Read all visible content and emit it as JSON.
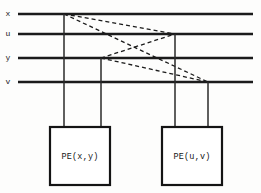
{
  "diagram": {
    "canvas": {
      "width": 261,
      "height": 193,
      "background": "#fdfdfc"
    },
    "colors": {
      "bus": "#1b1b1b",
      "drop": "#2a2a2a",
      "dashed": "#1b1b1b",
      "box_stroke": "#141414",
      "box_fill": "#ffffff",
      "text": "#171717"
    },
    "buses": [
      {
        "id": "bus-x",
        "label": "x",
        "y": 14,
        "x1": 18,
        "x2": 253,
        "label_x": 8
      },
      {
        "id": "bus-u",
        "label": "u",
        "y": 34,
        "x1": 18,
        "x2": 253,
        "label_x": 8
      },
      {
        "id": "bus-y",
        "label": "y",
        "y": 58,
        "x1": 18,
        "x2": 253,
        "label_x": 8
      },
      {
        "id": "bus-v",
        "label": "v",
        "y": 82,
        "x1": 18,
        "x2": 253,
        "label_x": 8
      }
    ],
    "drops": [
      {
        "id": "drop-x-to-left-pe",
        "from_bus": "x",
        "x": 64,
        "y1": 14,
        "y2": 127
      },
      {
        "id": "drop-y-to-left-pe",
        "from_bus": "y",
        "x": 101,
        "y1": 58,
        "y2": 127
      },
      {
        "id": "drop-u-to-right-pe",
        "from_bus": "u",
        "x": 175,
        "y1": 34,
        "y2": 127
      },
      {
        "id": "drop-v-to-right-pe",
        "from_bus": "v",
        "x": 208,
        "y1": 82,
        "y2": 127
      }
    ],
    "cross_links": [
      {
        "id": "link-x-u",
        "from": "x",
        "to": "u",
        "x1": 64,
        "y1": 14,
        "x2": 175,
        "y2": 34
      },
      {
        "id": "link-x-v",
        "from": "x",
        "to": "v",
        "x1": 64,
        "y1": 14,
        "x2": 208,
        "y2": 82
      },
      {
        "id": "link-y-u",
        "from": "y",
        "to": "u",
        "x1": 101,
        "y1": 58,
        "x2": 175,
        "y2": 34
      },
      {
        "id": "link-y-v",
        "from": "y",
        "to": "v",
        "x1": 101,
        "y1": 58,
        "x2": 208,
        "y2": 82
      }
    ],
    "pe_boxes": [
      {
        "id": "pe-left",
        "label": "PE(x,y)",
        "x": 50,
        "y": 127,
        "width": 60,
        "height": 58,
        "label_x": 80,
        "label_y": 157
      },
      {
        "id": "pe-right",
        "label": "PE(u,v)",
        "x": 162,
        "y": 127,
        "width": 60,
        "height": 58,
        "label_x": 192,
        "label_y": 157
      }
    ]
  }
}
